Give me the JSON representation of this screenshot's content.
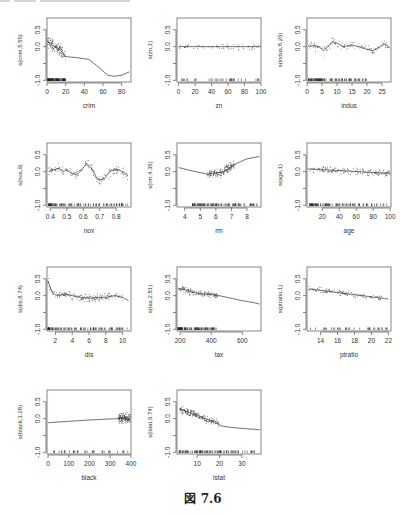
{
  "figure": {
    "caption": "図 7.6",
    "layout": {
      "rows": 4,
      "cols": 3
    }
  },
  "chart_data": [
    {
      "type": "scatter",
      "title": "",
      "xlabel": "crim",
      "ylabel": "s(crim,5.55)",
      "xlim": [
        0,
        90
      ],
      "ylim": [
        -1.05,
        0.85
      ],
      "xticks": [
        0,
        20,
        40,
        60,
        80
      ],
      "yticks": [
        -1.0,
        -0.5,
        0.0,
        0.5
      ],
      "ytick_labels": [
        "-1.0",
        "",
        "0.0",
        "0.5"
      ],
      "smooth": {
        "x": [
          0,
          2,
          5,
          10,
          15,
          20,
          30,
          45,
          55,
          65,
          72,
          80,
          88
        ],
        "y": [
          0.15,
          0.12,
          0.05,
          -0.02,
          -0.12,
          -0.3,
          -0.32,
          -0.38,
          -0.6,
          -0.85,
          -0.88,
          -0.85,
          -0.75
        ]
      },
      "point_cloud": {
        "x_range": [
          0,
          20
        ],
        "y_center": 0.05,
        "spread": 0.25,
        "n": 140
      },
      "rug": {
        "x_range": [
          0,
          20
        ],
        "dense": true
      }
    },
    {
      "type": "scatter",
      "title": "",
      "xlabel": "zn",
      "ylabel": "s(zn,1)",
      "xlim": [
        -2,
        100
      ],
      "ylim": [
        -1.05,
        0.85
      ],
      "xticks": [
        0,
        20,
        40,
        60,
        80,
        100
      ],
      "yticks": [
        -1.0,
        -0.5,
        0.0,
        0.5
      ],
      "ytick_labels": [
        "-1.0",
        "",
        "0.0",
        "0.5"
      ],
      "smooth": {
        "x": [
          0,
          100
        ],
        "y": [
          0.0,
          0.0
        ]
      },
      "point_cloud": {
        "x_range": [
          0,
          100
        ],
        "y_center": 0.0,
        "spread": 0.12,
        "n": 70
      },
      "rug": {
        "x_range": [
          0,
          100
        ],
        "dense": false
      }
    },
    {
      "type": "scatter",
      "title": "",
      "xlabel": "indus",
      "ylabel": "s(indus,8.26)",
      "xlim": [
        0,
        28
      ],
      "ylim": [
        -1.05,
        0.85
      ],
      "xticks": [
        0,
        5,
        10,
        15,
        20,
        25
      ],
      "yticks": [
        -1.0,
        -0.5,
        0.0,
        0.5
      ],
      "ytick_labels": [
        "-1.0",
        "",
        "0.0",
        "0.5"
      ],
      "smooth": {
        "x": [
          0.5,
          2,
          4,
          5.5,
          7,
          8.5,
          10,
          12,
          15,
          18,
          20,
          22,
          24,
          26,
          27.7
        ],
        "y": [
          0.0,
          0.03,
          0.0,
          -0.12,
          0.0,
          0.15,
          0.1,
          0.0,
          0.05,
          -0.02,
          -0.08,
          -0.12,
          -0.02,
          0.08,
          -0.05
        ]
      },
      "point_cloud": {
        "x_range": [
          0.5,
          27.7
        ],
        "y_center": 0.0,
        "spread": 0.18,
        "n": 120
      },
      "rug": {
        "x_range": [
          0.5,
          20
        ],
        "dense": true
      }
    },
    {
      "type": "scatter",
      "title": "",
      "xlabel": "nox",
      "ylabel": "s(nox,9)",
      "xlim": [
        0.38,
        0.89
      ],
      "ylim": [
        -1.05,
        0.85
      ],
      "xticks": [
        0.4,
        0.5,
        0.6,
        0.7,
        0.8
      ],
      "yticks": [
        -1.0,
        -0.5,
        0.0,
        0.5
      ],
      "ytick_labels": [
        "-1.0",
        "",
        "0.0",
        "0.5"
      ],
      "smooth": {
        "x": [
          0.39,
          0.42,
          0.45,
          0.48,
          0.5,
          0.53,
          0.56,
          0.59,
          0.62,
          0.65,
          0.68,
          0.7,
          0.73,
          0.76,
          0.8,
          0.84,
          0.87
        ],
        "y": [
          0.0,
          0.05,
          0.1,
          0.0,
          0.05,
          -0.05,
          -0.1,
          0.05,
          0.25,
          0.1,
          -0.18,
          -0.25,
          -0.2,
          0.0,
          0.08,
          0.0,
          -0.12
        ]
      },
      "point_cloud": {
        "x_range": [
          0.39,
          0.87
        ],
        "y_center": 0.0,
        "spread": 0.2,
        "n": 150
      },
      "rug": {
        "x_range": [
          0.39,
          0.87
        ],
        "dense": true
      }
    },
    {
      "type": "scatter",
      "title": "",
      "xlabel": "rm",
      "ylabel": "s(rm,4.35)",
      "xlim": [
        3.5,
        8.9
      ],
      "ylim": [
        -1.05,
        0.85
      ],
      "xticks": [
        4,
        5,
        6,
        7,
        8
      ],
      "yticks": [
        -1.0,
        -0.5,
        0.0,
        0.5
      ],
      "ytick_labels": [
        "-1.0",
        "",
        "0.0",
        "0.5"
      ],
      "smooth": {
        "x": [
          3.6,
          4.5,
          5.5,
          6.0,
          6.5,
          7.0,
          7.5,
          8.0,
          8.8
        ],
        "y": [
          0.12,
          0.02,
          -0.08,
          -0.05,
          0.0,
          0.15,
          0.28,
          0.38,
          0.45
        ]
      },
      "point_cloud": {
        "x_range": [
          5.4,
          7.2
        ],
        "y_center": -0.05,
        "spread": 0.2,
        "n": 180
      },
      "rug": {
        "x_range": [
          4.5,
          8.8
        ],
        "dense": true
      }
    },
    {
      "type": "scatter",
      "title": "",
      "xlabel": "age",
      "ylabel": "s(age,1)",
      "xlim": [
        2,
        101
      ],
      "ylim": [
        -1.05,
        0.85
      ],
      "xticks": [
        20,
        40,
        60,
        80,
        100
      ],
      "yticks": [
        -1.0,
        -0.5,
        0.0,
        0.5
      ],
      "ytick_labels": [
        "-1.0",
        "",
        "0.0",
        "0.5"
      ],
      "smooth": {
        "x": [
          3,
          100
        ],
        "y": [
          0.08,
          -0.05
        ]
      },
      "point_cloud": {
        "x_range": [
          5,
          100
        ],
        "y_center": 0.0,
        "spread": 0.15,
        "n": 180
      },
      "rug": {
        "x_range": [
          5,
          100
        ],
        "dense": true
      }
    },
    {
      "type": "scatter",
      "title": "",
      "xlabel": "dis",
      "ylabel": "s(dis,8.74)",
      "xlim": [
        1,
        11
      ],
      "ylim": [
        -1.05,
        0.85
      ],
      "xticks": [
        2,
        4,
        6,
        8,
        10
      ],
      "yticks": [
        -1.0,
        -0.5,
        0.0,
        0.5
      ],
      "ytick_labels": [
        "-1.0",
        "",
        "0.0",
        "0.5"
      ],
      "smooth": {
        "x": [
          1.1,
          1.3,
          1.6,
          2.0,
          2.5,
          3.0,
          4.0,
          5.0,
          6.0,
          7.0,
          8.0,
          9.0,
          10.0,
          10.7
        ],
        "y": [
          0.45,
          0.3,
          0.1,
          0.02,
          0.0,
          0.05,
          0.0,
          -0.05,
          -0.08,
          -0.05,
          -0.05,
          0.0,
          -0.05,
          -0.15
        ]
      },
      "point_cloud": {
        "x_range": [
          1.1,
          10
        ],
        "y_center": 0.0,
        "spread": 0.15,
        "n": 180
      },
      "rug": {
        "x_range": [
          1.1,
          10.7
        ],
        "dense": true
      }
    },
    {
      "type": "scatter",
      "title": "",
      "xlabel": "tax",
      "ylabel": "s(tax,2.81)",
      "xlim": [
        180,
        720
      ],
      "ylim": [
        -1.05,
        0.85
      ],
      "xticks": [
        200,
        400,
        600
      ],
      "yticks": [
        -1.0,
        -0.5,
        0.0,
        0.5
      ],
      "ytick_labels": [
        "-1.0",
        "",
        "0.0",
        "0.5"
      ],
      "smooth": {
        "x": [
          187,
          250,
          300,
          350,
          400,
          450,
          500,
          550,
          600,
          666,
          711
        ],
        "y": [
          0.22,
          0.15,
          0.08,
          0.05,
          0.03,
          0.0,
          -0.05,
          -0.1,
          -0.15,
          -0.2,
          -0.25
        ]
      },
      "point_cloud": {
        "x_range": [
          190,
          440
        ],
        "y_center": 0.1,
        "spread": 0.15,
        "n": 140
      },
      "rug": {
        "x_range": [
          187,
          440
        ],
        "dense": true
      }
    },
    {
      "type": "scatter",
      "title": "",
      "xlabel": "ptratio",
      "ylabel": "s(ptratio,1)",
      "xlim": [
        12.4,
        22.3
      ],
      "ylim": [
        -1.05,
        0.85
      ],
      "xticks": [
        14,
        16,
        18,
        20,
        22
      ],
      "yticks": [
        -1.0,
        -0.5,
        0.0,
        0.5
      ],
      "ytick_labels": [
        "-1.0",
        "",
        "0.0",
        "0.5"
      ],
      "smooth": {
        "x": [
          12.6,
          22.0
        ],
        "y": [
          0.2,
          -0.1
        ]
      },
      "point_cloud": {
        "x_range": [
          12.6,
          21.2
        ],
        "y_center": 0.05,
        "spread": 0.12,
        "n": 130
      },
      "rug": {
        "x_range": [
          12.6,
          22.0
        ],
        "dense": false
      }
    },
    {
      "type": "scatter",
      "title": "",
      "xlabel": "black",
      "ylabel": "s(black,1.28)",
      "xlim": [
        -5,
        400
      ],
      "ylim": [
        -1.05,
        0.85
      ],
      "xticks": [
        0,
        100,
        200,
        300,
        400
      ],
      "yticks": [
        -1.0,
        -0.5,
        0.0,
        0.5
      ],
      "ytick_labels": [
        "-1.0",
        "",
        "0.0",
        "0.5"
      ],
      "smooth": {
        "x": [
          0,
          100,
          200,
          300,
          396
        ],
        "y": [
          -0.12,
          -0.08,
          -0.04,
          -0.01,
          0.02
        ]
      },
      "point_cloud": {
        "x_range": [
          340,
          397
        ],
        "y_center": 0.0,
        "spread": 0.2,
        "n": 160
      },
      "rug": {
        "x_range": [
          0,
          397
        ],
        "dense": false
      }
    },
    {
      "type": "scatter",
      "title": "",
      "xlabel": "lstat",
      "ylabel": "s(lstat,6.74)",
      "xlim": [
        1,
        38.5
      ],
      "ylim": [
        -1.05,
        0.85
      ],
      "xticks": [
        10,
        20,
        30
      ],
      "yticks": [
        -1.0,
        -0.5,
        0.0,
        0.5
      ],
      "ytick_labels": [
        "-1.0",
        "",
        "0.0",
        "0.5"
      ],
      "smooth": {
        "x": [
          2,
          5,
          8,
          10,
          13,
          16,
          19,
          21,
          24,
          28,
          32,
          36,
          38
        ],
        "y": [
          0.28,
          0.22,
          0.15,
          0.1,
          0.02,
          -0.05,
          -0.15,
          -0.22,
          -0.25,
          -0.28,
          -0.3,
          -0.32,
          -0.33
        ]
      },
      "point_cloud": {
        "x_range": [
          2,
          20
        ],
        "y_center": 0.1,
        "spread": 0.15,
        "n": 200
      },
      "rug": {
        "x_range": [
          2,
          38
        ],
        "dense": true
      }
    }
  ]
}
